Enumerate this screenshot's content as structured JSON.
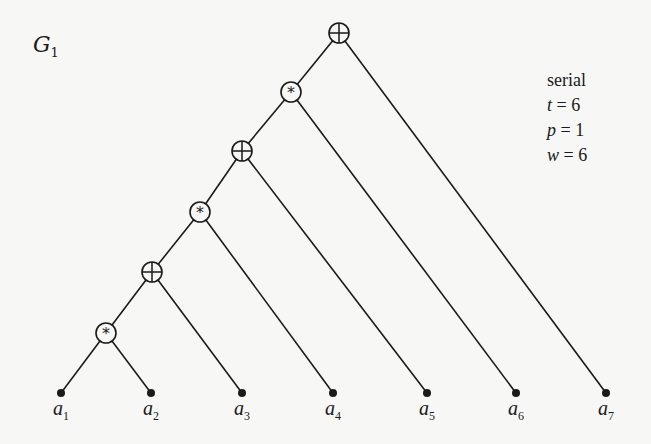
{
  "diagram": {
    "title": {
      "symbol": "G",
      "subscript": "1"
    },
    "params": [
      {
        "label": "serial",
        "var": "",
        "value": ""
      },
      {
        "label": "",
        "var": "t",
        "value": "= 6"
      },
      {
        "label": "",
        "var": "p",
        "value": "= 1"
      },
      {
        "label": "",
        "var": "w",
        "value": "= 6"
      }
    ],
    "nodes": [
      {
        "id": "n1",
        "op": "plus",
        "x": 339,
        "y": 33
      },
      {
        "id": "n2",
        "op": "times",
        "x": 291,
        "y": 92
      },
      {
        "id": "n3",
        "op": "plus",
        "x": 242,
        "y": 151
      },
      {
        "id": "n4",
        "op": "times",
        "x": 200,
        "y": 212
      },
      {
        "id": "n5",
        "op": "plus",
        "x": 152,
        "y": 272
      },
      {
        "id": "n6",
        "op": "times",
        "x": 106,
        "y": 333
      }
    ],
    "leaves": [
      {
        "id": "a1",
        "name": "a",
        "sub": "1",
        "x": 61,
        "y": 393
      },
      {
        "id": "a2",
        "name": "a",
        "sub": "2",
        "x": 151,
        "y": 393
      },
      {
        "id": "a3",
        "name": "a",
        "sub": "3",
        "x": 242,
        "y": 393
      },
      {
        "id": "a4",
        "name": "a",
        "sub": "4",
        "x": 333,
        "y": 393
      },
      {
        "id": "a5",
        "name": "a",
        "sub": "5",
        "x": 427,
        "y": 393
      },
      {
        "id": "a6",
        "name": "a",
        "sub": "6",
        "x": 516,
        "y": 393
      },
      {
        "id": "a7",
        "name": "a",
        "sub": "7",
        "x": 606,
        "y": 393
      }
    ],
    "edges": [
      [
        "n1",
        "n2"
      ],
      [
        "n1",
        "a7"
      ],
      [
        "n2",
        "n3"
      ],
      [
        "n2",
        "a6"
      ],
      [
        "n3",
        "n4"
      ],
      [
        "n3",
        "a5"
      ],
      [
        "n4",
        "n5"
      ],
      [
        "n4",
        "a4"
      ],
      [
        "n5",
        "n6"
      ],
      [
        "n5",
        "a3"
      ],
      [
        "n6",
        "a1"
      ],
      [
        "n6",
        "a2"
      ]
    ]
  }
}
